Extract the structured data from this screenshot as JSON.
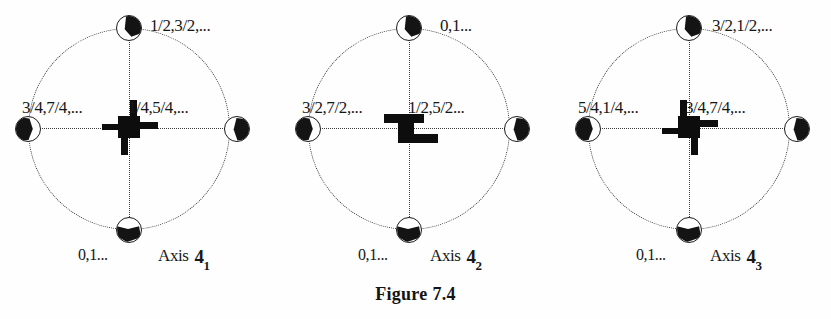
{
  "figure": {
    "caption": "Figure 7.4",
    "diagrams": [
      {
        "id": "axis-4-1",
        "symbol_name": "four-fold-screw-axis-4-1-symbol",
        "labels": {
          "top_right": "1/2,3/2,...",
          "left": "3/4,7/4,...",
          "right": "1/4,5/4,...",
          "bottom": "0,1...",
          "axis_name": "Axis",
          "axis_number": "4",
          "axis_subscript": "1"
        },
        "nodes": [
          {
            "position": "top",
            "name": "node-top"
          },
          {
            "position": "right",
            "name": "node-right"
          },
          {
            "position": "bottom",
            "name": "node-bottom"
          },
          {
            "position": "left",
            "name": "node-left"
          }
        ]
      },
      {
        "id": "axis-4-2",
        "symbol_name": "four-fold-screw-axis-4-2-symbol",
        "labels": {
          "top_right": "0,1...",
          "left": "3/2,7/2,...",
          "right": "1/2,5/2...",
          "bottom": "0,1...",
          "axis_name": "Axis",
          "axis_number": "4",
          "axis_subscript": "2"
        },
        "nodes": [
          {
            "position": "top",
            "name": "node-top"
          },
          {
            "position": "right",
            "name": "node-right"
          },
          {
            "position": "bottom",
            "name": "node-bottom"
          },
          {
            "position": "left",
            "name": "node-left"
          }
        ]
      },
      {
        "id": "axis-4-3",
        "symbol_name": "four-fold-screw-axis-4-3-symbol",
        "labels": {
          "top_right": "3/2,1/2,...",
          "left": "5/4,1/4,...",
          "right": "3/4,7/4,...",
          "bottom": "0,1...",
          "axis_name": "Axis",
          "axis_number": "4",
          "axis_subscript": "3"
        },
        "nodes": [
          {
            "position": "top",
            "name": "node-top"
          },
          {
            "position": "right",
            "name": "node-right"
          },
          {
            "position": "bottom",
            "name": "node-bottom"
          },
          {
            "position": "left",
            "name": "node-left"
          }
        ]
      }
    ],
    "colors": {
      "ink": "#141414",
      "dotted_line": "#3a3a3a",
      "page": "#fefefe"
    }
  }
}
